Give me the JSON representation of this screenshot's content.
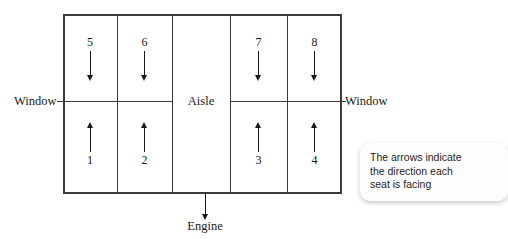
{
  "diagram": {
    "labels": {
      "window_left": "Window",
      "window_right": "Window",
      "aisle": "Aisle",
      "engine": "Engine"
    },
    "seats": [
      {
        "number": "5",
        "direction": "down",
        "row": "top",
        "column": 1
      },
      {
        "number": "6",
        "direction": "down",
        "row": "top",
        "column": 2
      },
      {
        "number": "7",
        "direction": "down",
        "row": "top",
        "column": 4
      },
      {
        "number": "8",
        "direction": "down",
        "row": "top",
        "column": 5
      },
      {
        "number": "1",
        "direction": "up",
        "row": "bottom",
        "column": 1
      },
      {
        "number": "2",
        "direction": "up",
        "row": "bottom",
        "column": 2
      },
      {
        "number": "3",
        "direction": "up",
        "row": "bottom",
        "column": 4
      },
      {
        "number": "4",
        "direction": "up",
        "row": "bottom",
        "column": 5
      }
    ],
    "callout": {
      "line1": "The arrows indicate",
      "line2": "the direction each",
      "line3": "seat is facing"
    },
    "colors": {
      "outline": "#3a3a3a",
      "divider": "#3a3a3a",
      "arrow": "#1a1a1a",
      "text": "#1a1a1a",
      "background": "#ffffff",
      "callout_background": "#fdfdfd"
    }
  }
}
